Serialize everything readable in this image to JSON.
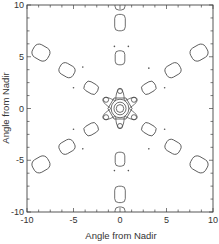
{
  "chart_data": {
    "type": "contour",
    "title": "",
    "xlabel": "Angle from Nadir",
    "ylabel": "Angle from Nadir",
    "xlim": [
      -10,
      10
    ],
    "ylim": [
      -10,
      10
    ],
    "xticks": [
      -10,
      -5,
      0,
      5,
      10
    ],
    "yticks": [
      -10,
      -5,
      0,
      5,
      10
    ],
    "xtick_labels": [
      "-10",
      "-5",
      "0",
      "5",
      "10"
    ],
    "ytick_labels": [
      "-10",
      "-5",
      "0",
      "5",
      "10"
    ],
    "minor_ticks_per_major": 4,
    "grid": false,
    "legend": null,
    "symmetry": "6-fold (hexagonal)",
    "central_peak": {
      "x": 0,
      "y": 0,
      "ring_radii": [
        0.4,
        0.65,
        0.95,
        1.3
      ],
      "outer_ring_shape": "hexagon"
    },
    "inner_lobes": [
      {
        "x": 0,
        "y": 1.7
      },
      {
        "x": 1.5,
        "y": 0.85
      },
      {
        "x": 1.5,
        "y": -0.85
      },
      {
        "x": 0,
        "y": -1.7
      },
      {
        "x": -1.5,
        "y": -0.85
      },
      {
        "x": -1.5,
        "y": 0.85
      }
    ],
    "sidelobe_arms": [
      {
        "direction_deg": 90,
        "lobes": [
          {
            "x": 0,
            "y": 4.9
          },
          {
            "x": 0,
            "y": 8.3
          },
          {
            "x": 0,
            "y": 10.0
          }
        ]
      },
      {
        "direction_deg": 270,
        "lobes": [
          {
            "x": 0,
            "y": -4.9
          },
          {
            "x": 0,
            "y": -8.3
          },
          {
            "x": 0,
            "y": -10.0
          }
        ]
      },
      {
        "direction_deg": 30,
        "lobes": [
          {
            "x": 3.1,
            "y": 2.0
          },
          {
            "x": 5.7,
            "y": 3.7
          },
          {
            "x": 8.5,
            "y": 5.4
          }
        ]
      },
      {
        "direction_deg": 150,
        "lobes": [
          {
            "x": -3.1,
            "y": 2.0
          },
          {
            "x": -5.7,
            "y": 3.7
          },
          {
            "x": -8.5,
            "y": 5.4
          }
        ]
      },
      {
        "direction_deg": 210,
        "lobes": [
          {
            "x": -3.1,
            "y": -2.0
          },
          {
            "x": -5.7,
            "y": -3.7
          },
          {
            "x": -8.5,
            "y": -5.4
          }
        ]
      },
      {
        "direction_deg": 330,
        "lobes": [
          {
            "x": 3.1,
            "y": -2.0
          },
          {
            "x": 5.7,
            "y": -3.7
          },
          {
            "x": 8.5,
            "y": -5.4
          }
        ]
      }
    ],
    "point_features": [
      {
        "x": -0.6,
        "y": 6.0
      },
      {
        "x": 0.9,
        "y": 6.0
      },
      {
        "x": -0.6,
        "y": -6.0
      },
      {
        "x": 0.9,
        "y": -6.0
      },
      {
        "x": -4.0,
        "y": 4.0
      },
      {
        "x": -5.0,
        "y": 2.0
      },
      {
        "x": 3.1,
        "y": 3.9
      },
      {
        "x": 4.8,
        "y": 2.0
      },
      {
        "x": -4.0,
        "y": -3.9
      },
      {
        "x": -5.0,
        "y": -2.0
      },
      {
        "x": 3.1,
        "y": -3.9
      },
      {
        "x": 4.8,
        "y": -2.0
      }
    ]
  }
}
